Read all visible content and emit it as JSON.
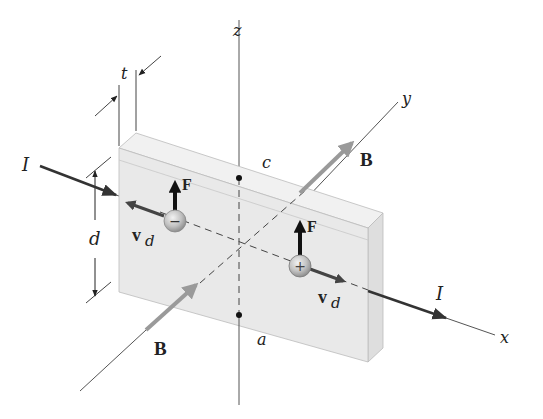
{
  "diagram": {
    "type": "hall-effect-slab",
    "axes": {
      "x": "x",
      "y": "y",
      "z": "z"
    },
    "dimensions": {
      "thickness": "t",
      "height": "d"
    },
    "points": {
      "top": "c",
      "bottom": "a"
    },
    "current": {
      "in_label": "I",
      "out_label": "I"
    },
    "magnetic_field": {
      "front_label": "B",
      "back_label": "B"
    },
    "negative_carrier": {
      "sign": "−",
      "force_label": "F",
      "velocity_label": "v",
      "velocity_subscript": "d"
    },
    "positive_carrier": {
      "sign": "+",
      "force_label": "F",
      "velocity_label": "v",
      "velocity_subscript": "d"
    },
    "colors": {
      "slab_face": "#e9e9e9",
      "slab_side": "#dcdcdc",
      "slab_top": "#f1f1f1",
      "axis": "#555555",
      "field_arrow": "#9a9a9a",
      "current_arrow": "#444444",
      "charge_fill": "#bdbdbd"
    }
  }
}
